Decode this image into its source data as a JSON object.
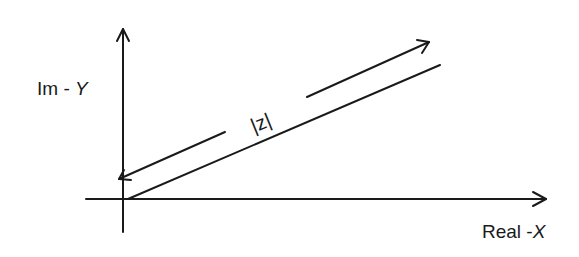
{
  "diagram": {
    "y_axis_label": {
      "prefix": "Im - ",
      "var": "Y"
    },
    "x_axis_label": {
      "prefix": "Real -",
      "var": "X"
    },
    "vector_label": "|z|",
    "colors": {
      "stroke": "#1a1a1a",
      "background": "#ffffff"
    }
  }
}
